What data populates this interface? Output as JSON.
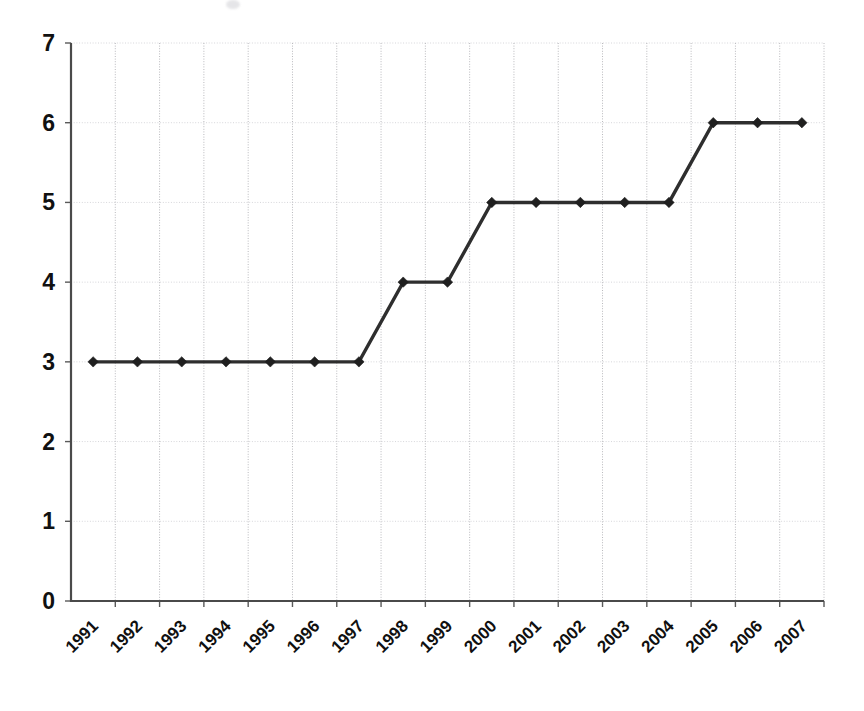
{
  "chart_data": {
    "type": "line",
    "title": "",
    "subtitle": "",
    "xlabel": "",
    "ylabel": "",
    "categories": [
      "1991",
      "1992",
      "1993",
      "1994",
      "1995",
      "1996",
      "1997",
      "1998",
      "1999",
      "2000",
      "2001",
      "2002",
      "2003",
      "2004",
      "2005",
      "2006",
      "2007"
    ],
    "values": [
      3,
      3,
      3,
      3,
      3,
      3,
      3,
      4,
      4,
      5,
      5,
      5,
      5,
      5,
      5,
      6,
      6
    ],
    "series": [
      {
        "name": "",
        "values": [
          3,
          3,
          3,
          3,
          3,
          3,
          3,
          4,
          4,
          5,
          5,
          5,
          5,
          5,
          6,
          6,
          6
        ]
      }
    ],
    "ylim": [
      0,
      7
    ],
    "yticks": [
      0,
      1,
      2,
      3,
      4,
      5,
      6,
      7
    ],
    "ytick_labels": [
      "0",
      "1",
      "2",
      "3",
      "4",
      "5",
      "6",
      "7"
    ],
    "xtick_label_rotation": -45,
    "grid": true,
    "grid_axes": "both",
    "legend": false,
    "legend_position": "none",
    "marker": "diamond",
    "line_color": "#2e2e2e",
    "marker_color": "#1f1f1f",
    "grid_color": "#c4c4c8",
    "axis_color": "#4a4a4a",
    "background_color": "#ffffff",
    "annotations": []
  },
  "figure": {
    "plot_area": {
      "left": 71,
      "top": 43,
      "right": 824,
      "bottom": 601
    }
  }
}
